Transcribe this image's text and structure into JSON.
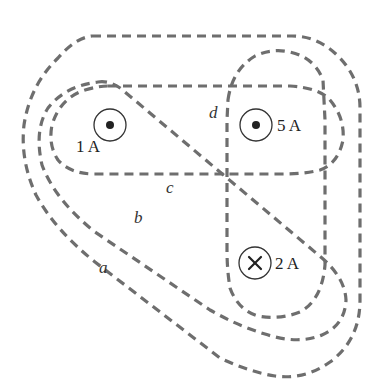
{
  "diagram": {
    "title": "",
    "colors": {
      "loop_stroke": "#6e6e6e",
      "wire_stroke": "#333333",
      "text": "#222222",
      "background": "#ffffff"
    },
    "wires": [
      {
        "id": "w1",
        "label": "1 A",
        "current_A": 1,
        "direction": "out-of-page",
        "symbol": "dot"
      },
      {
        "id": "w5",
        "label": "5 A",
        "current_A": 5,
        "direction": "out-of-page",
        "symbol": "dot"
      },
      {
        "id": "w2",
        "label": "2 A",
        "current_A": 2,
        "direction": "into-page",
        "symbol": "cross"
      }
    ],
    "loops": [
      {
        "id": "a",
        "label": "a",
        "encloses": [
          "1 A",
          "5 A",
          "2 A"
        ]
      },
      {
        "id": "b",
        "label": "b",
        "encloses": [
          "1 A",
          "2 A"
        ]
      },
      {
        "id": "c",
        "label": "c",
        "encloses": [
          "1 A",
          "5 A"
        ]
      },
      {
        "id": "d",
        "label": "d",
        "encloses": [
          "5 A",
          "2 A"
        ]
      }
    ]
  }
}
